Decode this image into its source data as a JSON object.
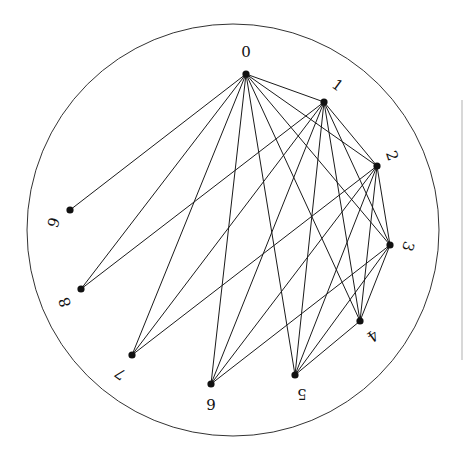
{
  "diagram": {
    "type": "circular-graph",
    "boundary_circle": {
      "cx": 233,
      "cy": 230,
      "r": 206
    },
    "nodes": [
      {
        "id": "0",
        "label": "0",
        "x": 246,
        "y": 74,
        "lx": 246,
        "ly": 53,
        "rot": 0
      },
      {
        "id": "1",
        "label": "1",
        "x": 324,
        "y": 102,
        "lx": 337,
        "ly": 86,
        "rot": 36
      },
      {
        "id": "2",
        "label": "2",
        "x": 377,
        "y": 166,
        "lx": 391,
        "ly": 156,
        "rot": 72
      },
      {
        "id": "3",
        "label": "3",
        "x": 390,
        "y": 245,
        "lx": 407,
        "ly": 246,
        "rot": 108
      },
      {
        "id": "4",
        "label": "4",
        "x": 360,
        "y": 321,
        "lx": 372,
        "ly": 335,
        "rot": 144
      },
      {
        "id": "5",
        "label": "5",
        "x": 295,
        "y": 375,
        "lx": 302,
        "ly": 393,
        "rot": 180
      },
      {
        "id": "6",
        "label": "6",
        "x": 211,
        "y": 384,
        "lx": 211,
        "ly": 403,
        "rot": 180
      },
      {
        "id": "7",
        "label": "7",
        "x": 132,
        "y": 355,
        "lx": 121,
        "ly": 373,
        "rot": 216
      },
      {
        "id": "8",
        "label": "8",
        "x": 81,
        "y": 289,
        "lx": 66,
        "ly": 302,
        "rot": 252
      },
      {
        "id": "9",
        "label": "9",
        "x": 70,
        "y": 210,
        "lx": 55,
        "ly": 223,
        "rot": 288
      }
    ],
    "edges": [
      [
        "0",
        "1"
      ],
      [
        "0",
        "2"
      ],
      [
        "0",
        "3"
      ],
      [
        "0",
        "4"
      ],
      [
        "0",
        "5"
      ],
      [
        "0",
        "6"
      ],
      [
        "0",
        "7"
      ],
      [
        "0",
        "8"
      ],
      [
        "0",
        "9"
      ],
      [
        "1",
        "2"
      ],
      [
        "1",
        "3"
      ],
      [
        "1",
        "4"
      ],
      [
        "1",
        "5"
      ],
      [
        "1",
        "6"
      ],
      [
        "1",
        "7"
      ],
      [
        "1",
        "8"
      ],
      [
        "2",
        "3"
      ],
      [
        "2",
        "4"
      ],
      [
        "2",
        "5"
      ],
      [
        "2",
        "6"
      ],
      [
        "2",
        "7"
      ],
      [
        "3",
        "4"
      ],
      [
        "3",
        "5"
      ],
      [
        "3",
        "6"
      ],
      [
        "4",
        "5"
      ]
    ],
    "colors": {
      "edge": "#1a1a1a",
      "node": "#111111",
      "boundary": "#333333",
      "background": "#ffffff"
    }
  }
}
